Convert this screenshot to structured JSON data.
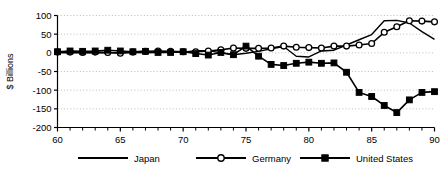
{
  "chart_data": {
    "type": "line",
    "title": "",
    "xlabel": "",
    "ylabel": "$ Billions",
    "xlim": [
      60,
      90
    ],
    "ylim": [
      -200,
      100
    ],
    "yticks": [
      100,
      50,
      0,
      -50,
      -100,
      -150,
      -200
    ],
    "ytick_labels": [
      "100",
      "50",
      "0",
      "-50",
      "-100",
      "-150",
      "-200"
    ],
    "xticks": [
      60,
      65,
      70,
      75,
      80,
      85,
      90
    ],
    "xtick_labels": [
      "60",
      "65",
      "70",
      "75",
      "80",
      "85",
      "90"
    ],
    "xtick_minor": [
      61,
      62,
      63,
      64,
      66,
      67,
      68,
      69,
      71,
      72,
      73,
      74,
      76,
      77,
      78,
      79,
      81,
      82,
      83,
      84,
      86,
      87,
      88,
      89
    ],
    "grid": "horizontal-dotted",
    "legend_position": "below-center",
    "x": [
      60,
      61,
      62,
      63,
      64,
      65,
      66,
      67,
      68,
      69,
      70,
      71,
      72,
      73,
      74,
      75,
      76,
      77,
      78,
      79,
      80,
      81,
      82,
      83,
      84,
      85,
      86,
      87,
      88,
      89,
      90
    ],
    "series": [
      {
        "name": "Japan",
        "marker": "none",
        "color": "#000000",
        "values": [
          0,
          0,
          0,
          0,
          0,
          1,
          1,
          0,
          1,
          2,
          2,
          6,
          6,
          0,
          -5,
          -1,
          4,
          11,
          17,
          -9,
          -11,
          5,
          7,
          21,
          35,
          49,
          86,
          87,
          80,
          57,
          36
        ]
      },
      {
        "name": "Germany",
        "marker": "open-circle",
        "color": "#000000",
        "values": [
          2,
          2,
          1,
          2,
          1,
          -1,
          2,
          4,
          5,
          4,
          3,
          3,
          5,
          8,
          13,
          12,
          12,
          13,
          18,
          15,
          14,
          13,
          18,
          18,
          21,
          25,
          55,
          70,
          86,
          85,
          83
        ]
      },
      {
        "name": "United States",
        "marker": "filled-square",
        "color": "#000000",
        "values": [
          3,
          5,
          4,
          5,
          7,
          5,
          3,
          4,
          1,
          1,
          3,
          -2,
          -6,
          1,
          -5,
          18,
          -9,
          -31,
          -34,
          -28,
          -25,
          -28,
          -27,
          -52,
          -106,
          -117,
          -141,
          -160,
          -126,
          -106,
          -104
        ]
      }
    ]
  },
  "legend": {
    "items": [
      {
        "label": "Japan",
        "marker": "none"
      },
      {
        "label": "Germany",
        "marker": "open-circle"
      },
      {
        "label": "United States",
        "marker": "filled-square"
      }
    ]
  },
  "colors": {
    "axis": "#000000",
    "grid": "#bbbbbb",
    "background": "#ffffff",
    "series": "#000000"
  }
}
